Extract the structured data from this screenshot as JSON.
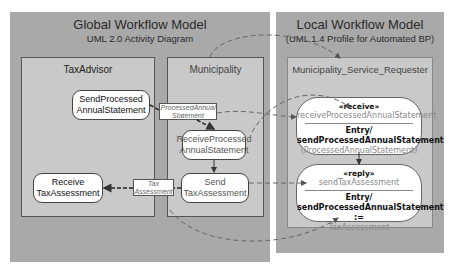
{
  "global_model": {
    "title": "Global Workflow Model",
    "subtitle": "UML 2.0 Activity Diagram",
    "lanes": [
      {
        "name": "TaxAdvisor",
        "actions": [
          {
            "line1": "SendProcessed",
            "line2": "AnnualStatement"
          },
          {
            "line1": "Receive",
            "line2": "TaxAssessment"
          }
        ]
      },
      {
        "name": "Municipality",
        "actions": [
          {
            "line1": "ReceiveProcessed",
            "line2": "AnnualStatement"
          },
          {
            "line1": "Send",
            "line2": "TaxAssessment"
          }
        ]
      }
    ],
    "object_nodes": [
      {
        "line1": "ProcessedAnnual",
        "line2": "Statement"
      },
      {
        "line1": "Tax",
        "line2": "Assessment"
      }
    ]
  },
  "local_model": {
    "title": "Local Workflow Model",
    "subtitle": "(UML 1.4 Profile for Automated BP)",
    "lane": "Municipality_Service_Requester",
    "states": [
      {
        "stereotype": "«receive»",
        "name": "receiveProcessedAnnualStatement",
        "entry_label": "Entry/",
        "entry_action": "sendProcessedAnnualStatement",
        "entry_param": "(ProcessedAnnualStatement)"
      },
      {
        "stereotype": "«reply»",
        "name": "sendTaxAssessment",
        "entry_label": "Entry/",
        "entry_action": "sendProcessedAnnualStatement :=",
        "entry_param": "TaxAssessment"
      }
    ]
  },
  "colors": {
    "panel": "#a9a9a9",
    "lane": "#c9c9c9",
    "dashed_mapping": "#6a6a6a"
  }
}
